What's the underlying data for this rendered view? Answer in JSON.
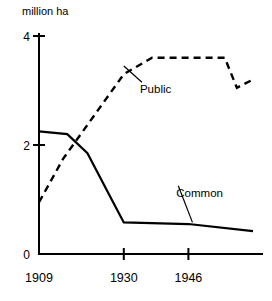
{
  "chart_data": {
    "type": "line",
    "title": "",
    "subtitle": "",
    "ylabel": "million ha",
    "xlabel": "",
    "ylim": [
      0,
      4
    ],
    "xlim": [
      1909,
      1962
    ],
    "grid": false,
    "legend_position": "inline-annotations",
    "y_ticks": [
      "0",
      "2",
      "4"
    ],
    "y_tick_values": [
      0,
      2,
      4
    ],
    "x_ticks": [
      "1909",
      "1930",
      "1946"
    ],
    "x_tick_values": [
      1909,
      1930,
      1946
    ],
    "series": [
      {
        "name": "Public",
        "style": "dashed",
        "label": "Public",
        "x": [
          1909,
          1915,
          1930,
          1937,
          1955,
          1958,
          1962
        ],
        "values": [
          0.95,
          1.75,
          3.3,
          3.6,
          3.6,
          3.05,
          3.2
        ]
      },
      {
        "name": "Common",
        "style": "solid",
        "label": "Common",
        "x": [
          1909,
          1916,
          1921,
          1927,
          1930,
          1946,
          1962
        ],
        "values": [
          2.25,
          2.2,
          1.85,
          1.0,
          0.58,
          0.55,
          0.42
        ]
      }
    ],
    "annotations": [
      {
        "text": "Public",
        "target_x": 1930,
        "target_y": 3.45,
        "label_x": 1934,
        "label_y": 2.95
      },
      {
        "text": "Common",
        "target_x": 1947,
        "target_y": 0.58,
        "label_x": 1943,
        "label_y": 1.05
      }
    ],
    "colors": {
      "line": "#000000",
      "axis": "#000000",
      "background": "#ffffff"
    }
  }
}
